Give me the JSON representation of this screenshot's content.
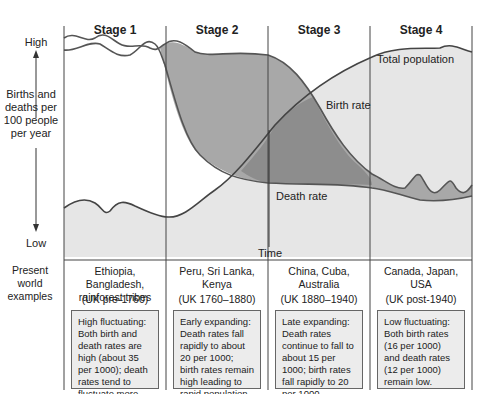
{
  "stages": [
    {
      "label": "Stage 1",
      "examples": "Ethiopia, Bangladesh, rainforest tribes",
      "uk_period": "(UK pre-1760)",
      "description": "High fluctuating: Both birth and death rates are high (about 35 per 1000); death rates tend to fluctuate more than birth rates."
    },
    {
      "label": "Stage 2",
      "examples": "Peru, Sri Lanka, Kenya",
      "uk_period": "(UK 1760–1880)",
      "description": "Early expanding: Death rates fall rapidly to about 20 per 1000; birth rates remain high leading to rapid population growth."
    },
    {
      "label": "Stage 3",
      "examples": "China, Cuba, Australia",
      "uk_period": "(UK 1880–1940)",
      "description": "Late expanding: Death rates continue to fall to about 15 per 1000; birth rates fall rapidly to 20 per 1000."
    },
    {
      "label": "Stage 4",
      "examples": "Canada, Japan, USA",
      "uk_period": "(UK post-1940)",
      "description": "Low fluctuating: Both birth rates (16 per 1000) and death rates (12 per 1000) remain low."
    }
  ],
  "axis": {
    "y_high": "High",
    "y_low": "Low",
    "y_label": "Births and deaths per 100 people per year",
    "x_label": "Time",
    "row_label": "Present world examples"
  },
  "curve_labels": {
    "total_population": "Total population",
    "birth_rate": "Birth rate",
    "death_rate": "Death rate"
  },
  "colors": {
    "population_fill": "#e4e4e4",
    "growth_fill": "#a9a9a9",
    "overlap_fill": "#8c8c8c",
    "birth_line": "#555555",
    "death_line": "#555555",
    "box_fill": "#ececec"
  }
}
